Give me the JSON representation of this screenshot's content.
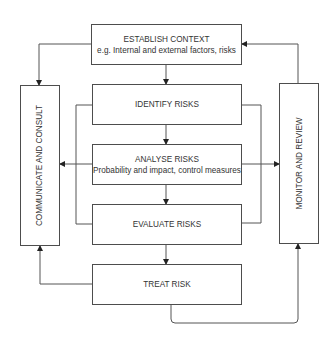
{
  "diagram": {
    "type": "risk-management-process",
    "nodes": {
      "establish_context": {
        "title": "ESTABLISH CONTEXT",
        "subtitle": "e.g. Internal and external factors, risks"
      },
      "identify_risks": {
        "title": "IDENTIFY RISKS"
      },
      "analyse_risks": {
        "title": "ANALYSE RISKS",
        "subtitle": "Probability and impact, control measures"
      },
      "evaluate_risks": {
        "title": "EVALUATE RISKS"
      },
      "treat_risk": {
        "title": "TREAT RISK"
      },
      "communicate_consult": {
        "title": "COMMUNICATE AND CONSULT"
      },
      "monitor_review": {
        "title": "MONITOR AND REVIEW"
      }
    },
    "edges": [
      {
        "from": "establish_context",
        "to": "identify_risks"
      },
      {
        "from": "identify_risks",
        "to": "analyse_risks"
      },
      {
        "from": "analyse_risks",
        "to": "evaluate_risks"
      },
      {
        "from": "evaluate_risks",
        "to": "treat_risk"
      },
      {
        "from": "establish_context",
        "to": "communicate_consult"
      },
      {
        "from": "identify_risks/analyse_risks/evaluate_risks",
        "to": "communicate_consult"
      },
      {
        "from": "identify_risks/analyse_risks/evaluate_risks",
        "to": "monitor_review"
      },
      {
        "from": "treat_risk",
        "to": "communicate_consult"
      },
      {
        "from": "treat_risk",
        "to": "monitor_review"
      },
      {
        "from": "monitor_review",
        "to": "establish_context"
      }
    ],
    "colors": {
      "stroke": "#4d4d4d",
      "text": "#333333",
      "background": "#ffffff"
    }
  }
}
